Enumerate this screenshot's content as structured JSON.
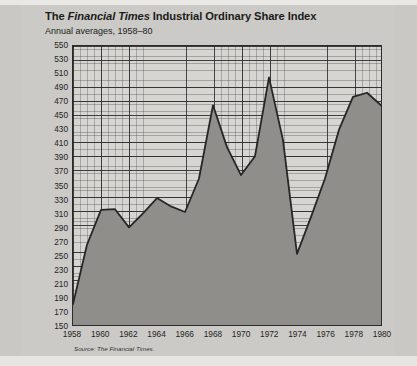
{
  "figure": {
    "title_prefix": "The ",
    "title_italic": "Financial Times",
    "title_suffix": " Industrial Ordinary Share Index",
    "subtitle": "Annual averages, 1958–80",
    "source": "Source: The Financial Times.",
    "colors": {
      "paper": "#cbcac6",
      "plot_background": "#d6d5d1",
      "area_fill": "#8f8e8a",
      "line": "#262626",
      "axis": "#2b2b2b",
      "text": "#1c1c1c"
    }
  },
  "chart_data": {
    "type": "area",
    "title": "The Financial Times Industrial Ordinary Share Index",
    "subtitle": "Annual averages, 1958–80",
    "xlabel": "",
    "ylabel": "",
    "xlim": [
      1958,
      1980
    ],
    "ylim": [
      150,
      550
    ],
    "grid": true,
    "legend": "none",
    "y_ticks": [
      150,
      170,
      190,
      210,
      230,
      250,
      270,
      290,
      310,
      330,
      350,
      370,
      390,
      410,
      430,
      450,
      470,
      490,
      510,
      530,
      550
    ],
    "x_ticks": [
      1958,
      1960,
      1962,
      1964,
      1966,
      1968,
      1970,
      1972,
      1974,
      1976,
      1978,
      1980
    ],
    "x": [
      1958,
      1959,
      1960,
      1961,
      1962,
      1963,
      1964,
      1965,
      1966,
      1967,
      1968,
      1969,
      1970,
      1971,
      1972,
      1973,
      1974,
      1975,
      1976,
      1977,
      1978,
      1979,
      1980
    ],
    "values": [
      180,
      265,
      315,
      316,
      290,
      310,
      332,
      320,
      312,
      360,
      465,
      405,
      365,
      392,
      505,
      415,
      252,
      305,
      360,
      430,
      477,
      483,
      465
    ],
    "series": [
      {
        "name": "FT Industrial Ordinary Share Index",
        "values": [
          180,
          265,
          315,
          316,
          290,
          310,
          332,
          320,
          312,
          360,
          465,
          405,
          365,
          392,
          505,
          415,
          252,
          305,
          360,
          430,
          477,
          483,
          465
        ]
      }
    ]
  }
}
